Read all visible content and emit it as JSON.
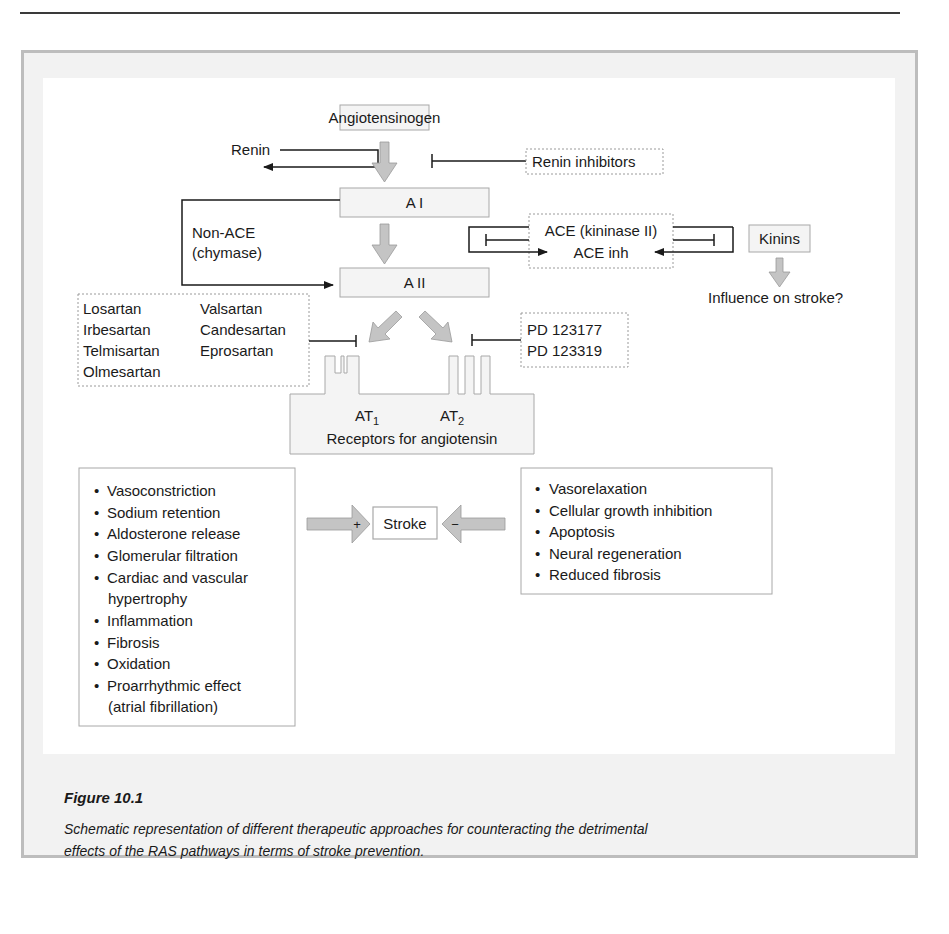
{
  "figure": {
    "label": "Figure 10.1",
    "caption_line1": "Schematic representation of different therapeutic approaches for counteracting the detrimental",
    "caption_line2": "effects of the RAS pathways in terms of stroke prevention."
  },
  "diagram": {
    "angiotensinogen": "Angiotensinogen",
    "renin": "Renin",
    "renin_inhibitors": "Renin inhibitors",
    "a1": "A I",
    "a2": "A II",
    "non_ace_line1": "Non-ACE",
    "non_ace_line2": "(chymase)",
    "ace_line1": "ACE (kininase II)",
    "ace_line2": "ACE inh",
    "kinins": "Kinins",
    "influence": "Influence on stroke?",
    "arbs": {
      "col1": [
        "Losartan",
        "Irbesartan",
        "Telmisartan",
        "Olmesartan"
      ],
      "col2": [
        "Valsartan",
        "Candesartan",
        "Eprosartan"
      ]
    },
    "at2_blockers": [
      "PD 123177",
      "PD 123319"
    ],
    "receptors": {
      "at1": "AT",
      "at1_sub": "1",
      "at2": "AT",
      "at2_sub": "2",
      "label": "Receptors for angiotensin"
    },
    "stroke": "Stroke",
    "plus_sign": "+",
    "minus_sign": "−",
    "at1_effects": [
      "Vasoconstriction",
      "Sodium retention",
      "Aldosterone release",
      "Glomerular filtration",
      "Cardiac and vascular",
      "hypertrophy",
      "Inflammation",
      "Fibrosis",
      "Oxidation",
      "Proarrhythmic effect",
      "(atrial fibrillation)"
    ],
    "at2_effects": [
      "Vasorelaxation",
      "Cellular growth inhibition",
      "Apoptosis",
      "Neural regeneration",
      "Reduced fibrosis"
    ],
    "bullet": "•",
    "colors": {
      "box_fill": "#f4f4f4",
      "box_stroke": "#a8a8a8",
      "arrow_fill": "#c4c4c4",
      "arrow_stroke": "#9a9a9a",
      "line": "#1a1a1a",
      "frame_bg": "#f2f2f2",
      "frame_border": "#bdbdbd"
    }
  }
}
